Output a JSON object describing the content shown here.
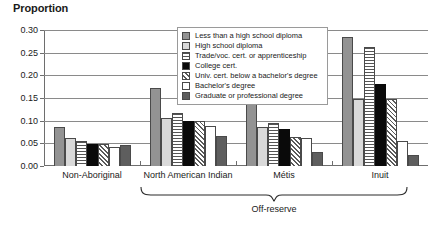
{
  "chart_data": {
    "type": "bar",
    "title": "Proportion",
    "xlabel": "",
    "ylabel": "Proportion",
    "ylim": [
      0.0,
      0.3
    ],
    "yticks": [
      "0.00",
      "0.05",
      "0.10",
      "0.15",
      "0.20",
      "0.25",
      "0.30"
    ],
    "ytick_values": [
      0.0,
      0.05,
      0.1,
      0.15,
      0.2,
      0.25,
      0.3
    ],
    "grid": true,
    "legend_position": "top-center",
    "categories": [
      "Non-Aboriginal",
      "North American Indian",
      "Métis",
      "Inuit"
    ],
    "group_annotation": {
      "label": "Off-reserve",
      "covers": [
        "North American Indian",
        "Métis",
        "Inuit"
      ]
    },
    "series": [
      {
        "name": "Less than a high school diploma",
        "fill": "f-gray",
        "color": "#939393",
        "values": [
          0.085,
          0.172,
          0.148,
          0.285
        ]
      },
      {
        "name": "High school diploma",
        "fill": "f-lightgray",
        "color": "#d9d9d9",
        "values": [
          0.062,
          0.105,
          0.087,
          0.148
        ]
      },
      {
        "name": "Trade/voc. cert. or apprenticeship",
        "fill": "f-hstripe",
        "color": "#ffffff",
        "values": [
          0.055,
          0.118,
          0.095,
          0.262
        ]
      },
      {
        "name": "College cert.",
        "fill": "f-black",
        "color": "#0a0a0a",
        "values": [
          0.048,
          0.099,
          0.081,
          0.182
        ]
      },
      {
        "name": "Univ. cert. below a bachelor's degree",
        "fill": "f-hatch",
        "color": "#ffffff",
        "values": [
          0.049,
          0.1,
          0.063,
          0.148
        ]
      },
      {
        "name": "Bachelor's degree",
        "fill": "f-white",
        "color": "#ffffff",
        "values": [
          0.043,
          0.089,
          0.062,
          0.055
        ]
      },
      {
        "name": "Graduate or professional degree",
        "fill": "f-darkgray",
        "color": "#5e5e5e",
        "values": [
          0.047,
          0.066,
          0.032,
          0.025
        ]
      }
    ]
  }
}
